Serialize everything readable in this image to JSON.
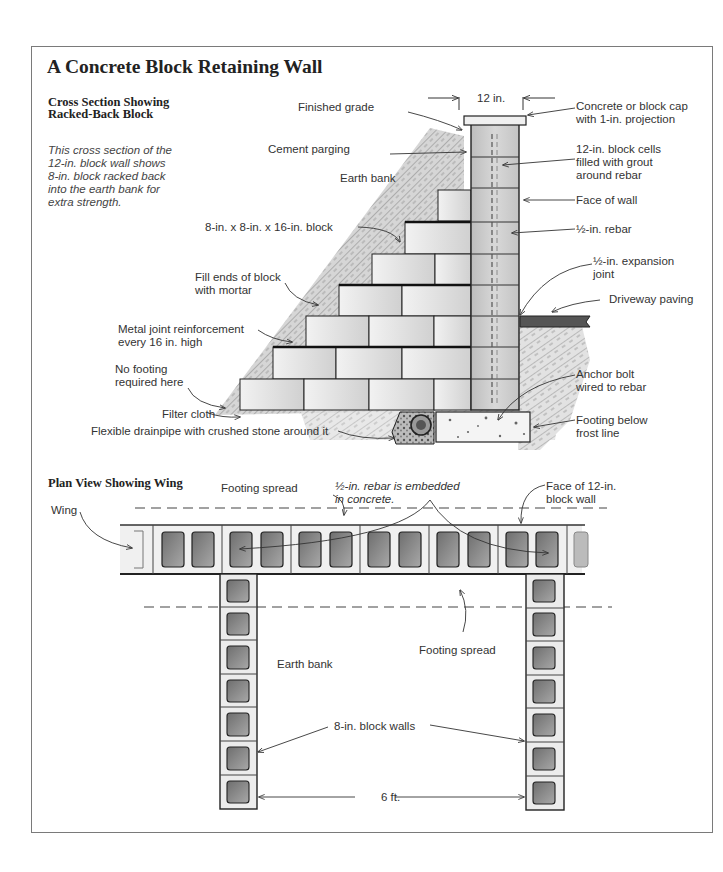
{
  "title": "A Concrete Block Retaining Wall",
  "cross_section": {
    "heading_line1": "Cross Section Showing",
    "heading_line2": "Racked-Back Block",
    "description": "This cross section of the 12-in. block wall shows 8-in. block racked back into the earth bank for extra strength.",
    "dimension_label": "12 in.",
    "labels": {
      "finished_grade": "Finished grade",
      "cement_parging": "Cement parging",
      "earth_bank": "Earth bank",
      "block_size": "8-in. x 8-in. x 16-in. block",
      "fill_ends_1": "Fill ends of block",
      "fill_ends_2": "with mortar",
      "metal_joint_1": "Metal joint reinforcement",
      "metal_joint_2": "every 16 in. high",
      "no_footing_1": "No footing",
      "no_footing_2": "required here",
      "filter_cloth": "Filter cloth",
      "drainpipe": "Flexible drainpipe with crushed stone around it",
      "cap_1": "Concrete or block cap",
      "cap_2": "with 1-in. projection",
      "cells_1": "12-in. block cells",
      "cells_2": "filled with grout",
      "cells_3": "around rebar",
      "face_of_wall": "Face of wall",
      "rebar": "½-in. rebar",
      "expansion_1": "½-in. expansion",
      "expansion_2": "joint",
      "driveway": "Driveway paving",
      "anchor_1": "Anchor bolt",
      "anchor_2": "wired to rebar",
      "footing_1": "Footing below",
      "footing_2": "frost line"
    }
  },
  "plan_view": {
    "heading": "Plan View Showing Wing",
    "labels": {
      "footing_spread_top": "Footing spread",
      "rebar_note_1": "½-in. rebar is embedded",
      "rebar_note_2": "in concrete.",
      "face_12in_1": "Face of 12-in.",
      "face_12in_2": "block wall",
      "wing": "Wing",
      "footing_spread_bottom": "Footing spread",
      "earth_bank": "Earth bank",
      "block_walls": "8-in. block walls",
      "spacing": "6 ft."
    }
  },
  "colors": {
    "frame": "#7a7a7a",
    "ink": "#222222",
    "block_fill": "#e6e6e6",
    "cell_fill": "#8c8c8c",
    "earth": "#bdbdbd"
  }
}
